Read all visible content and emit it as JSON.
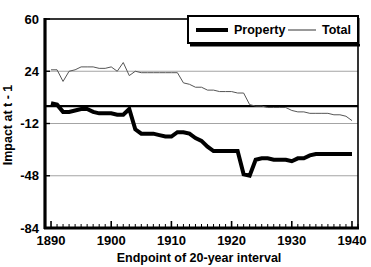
{
  "chart_data": {
    "type": "line",
    "title": "",
    "xlabel": "Endpoint of 20-year interval",
    "ylabel": "Impact at t - 1",
    "xlim": [
      1889,
      1941
    ],
    "ylim": [
      -84,
      60
    ],
    "xticks": [
      1890,
      1900,
      1910,
      1920,
      1930,
      1940
    ],
    "xtick_labels": [
      "1890",
      "1900",
      "1910",
      "1920",
      "1930",
      "1940"
    ],
    "yticks": [
      -84,
      -48,
      -12,
      24,
      60
    ],
    "ytick_labels": [
      "-84",
      "-48",
      "-12",
      "24",
      "60"
    ],
    "minor_xtick_interval": 1,
    "grid": "horizontal",
    "legend_position": "top-right",
    "legend_entries": [
      {
        "name": "Property",
        "style": "thick-black-line",
        "color": "#000000",
        "width": 4
      },
      {
        "name": "Total",
        "style": "thin-gray-line",
        "color": "#555555",
        "width": 1
      }
    ],
    "x": [
      1890,
      1891,
      1892,
      1893,
      1894,
      1895,
      1896,
      1897,
      1898,
      1899,
      1900,
      1901,
      1902,
      1903,
      1904,
      1905,
      1906,
      1907,
      1908,
      1909,
      1910,
      1911,
      1912,
      1913,
      1914,
      1915,
      1916,
      1917,
      1918,
      1919,
      1920,
      1921,
      1922,
      1923,
      1924,
      1925,
      1926,
      1927,
      1928,
      1929,
      1930,
      1931,
      1932,
      1933,
      1934,
      1935,
      1936,
      1937,
      1938,
      1939,
      1940
    ],
    "series": [
      {
        "name": "Property",
        "color": "#000000",
        "width": 4,
        "values": [
          2,
          1,
          -4,
          -4,
          -3,
          -2,
          -2,
          -4,
          -5,
          -5,
          -5,
          -6,
          -6,
          -2,
          -16,
          -19,
          -19,
          -19,
          -20,
          -21,
          -21,
          -18,
          -18,
          -19,
          -22,
          -24,
          -28,
          -31,
          -31,
          -31,
          -31,
          -31,
          -47,
          -48,
          -37,
          -36,
          -36,
          -37,
          -37,
          -37,
          -38,
          -36,
          -36,
          -34,
          -33,
          -33,
          -33,
          -33,
          -33,
          -33,
          -33
        ]
      },
      {
        "name": "Total",
        "color": "#555555",
        "width": 1,
        "values": [
          25,
          25,
          17,
          24,
          25,
          27,
          27,
          27,
          26,
          26,
          27,
          24,
          30,
          21,
          24,
          23,
          23,
          23,
          23,
          23,
          23,
          23,
          16,
          15,
          13,
          13,
          11,
          11,
          10,
          10,
          10,
          9,
          9,
          1,
          0,
          0,
          -1,
          -1,
          -1,
          -1,
          -3,
          -4,
          -4,
          -5,
          -5,
          -5,
          -5,
          -6,
          -6,
          -7,
          -10
        ]
      }
    ]
  }
}
